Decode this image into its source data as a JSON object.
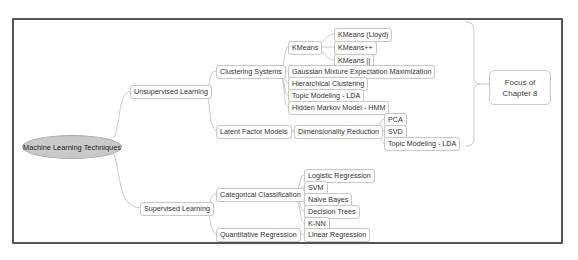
{
  "root": {
    "label": "Machine Learning Techniques"
  },
  "branches": {
    "unsupervised": {
      "label": "Unsupervised Learning",
      "clustering": {
        "label": "Clustering Systems",
        "kmeans": {
          "label": "KMeans",
          "children": [
            "KMeans (Lloyd)",
            "KMeans++",
            "KMeans ||"
          ]
        },
        "children": [
          "Gaussian Mixture Expectation Maximization",
          "Hierarchical Clustering",
          "Topic Modeling - LDA",
          "Hidden Markov Model - HMM"
        ]
      },
      "latent": {
        "label": "Latent Factor Models",
        "dimred": {
          "label": "Dimensionality Reduction",
          "children": [
            "PCA",
            "SVD",
            "Topic Modeling - LDA"
          ]
        }
      }
    },
    "supervised": {
      "label": "Supervised Learning",
      "categorical": {
        "label": "Categorical Classification",
        "children": [
          "Logistic Regression",
          "SVM",
          "Naive Bayes",
          "Decision Trees",
          "K-NN"
        ]
      },
      "quantitative": {
        "label": "Quantitative Regression",
        "children": [
          "Linear Regression"
        ]
      }
    }
  },
  "callout": {
    "line1": "Focus of",
    "line2": "Chapter 8"
  }
}
